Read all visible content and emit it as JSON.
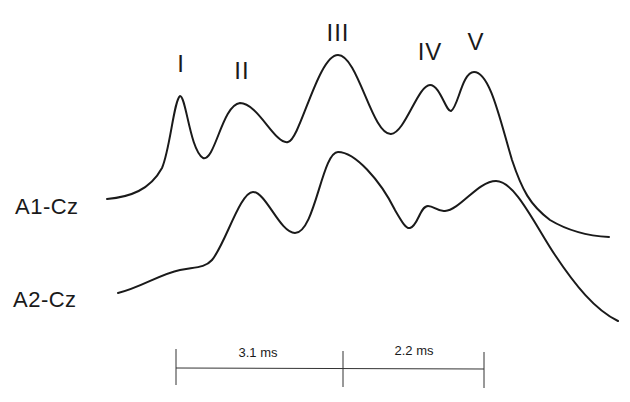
{
  "figure": {
    "peaks": [
      {
        "label": "I",
        "x": 181,
        "y": 52
      },
      {
        "label": "II",
        "x": 242,
        "y": 59
      },
      {
        "label": "III",
        "x": 338,
        "y": 21
      },
      {
        "label": "IV",
        "x": 430,
        "y": 40
      },
      {
        "label": "V",
        "x": 476,
        "y": 30
      }
    ],
    "traces": [
      {
        "name": "A1-Cz",
        "label_x": 15,
        "label_y": 196
      },
      {
        "name": "A2-Cz",
        "label_x": 13,
        "label_y": 289
      }
    ],
    "scale_bar": {
      "segments": [
        {
          "label": "3.1 ms",
          "x_start": 176,
          "x_end": 343
        },
        {
          "label": "2.2 ms",
          "x_start": 343,
          "x_end": 484
        }
      ]
    },
    "colors": {
      "ink": "#1a1a1a",
      "background": "#ffffff"
    }
  }
}
